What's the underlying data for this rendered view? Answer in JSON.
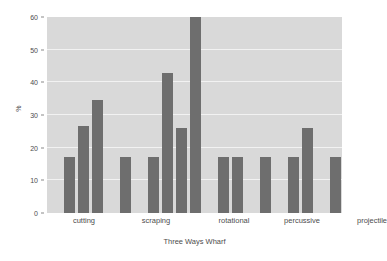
{
  "chart_data": {
    "type": "bar",
    "title": "",
    "subtitle": "",
    "xlabel": "Three Ways Wharf",
    "ylabel": "%",
    "ylim": [
      0,
      60
    ],
    "yticks": [
      0,
      10,
      20,
      30,
      40,
      50,
      60
    ],
    "grid": true,
    "legend": "none",
    "categories": [
      "cutting",
      "scraping",
      "rotational",
      "percussive",
      "projectile"
    ],
    "bar_color": "#6e6e6e",
    "plot_background": "#d9d9d9",
    "gridline_color": "#f2f2f2",
    "bars": [
      {
        "group": "cutting",
        "index": 0,
        "value": 17
      },
      {
        "group": "cutting",
        "index": 1,
        "value": 26.5
      },
      {
        "group": "cutting",
        "index": 2,
        "value": 34.5
      },
      {
        "group": "cutting",
        "index": 3,
        "value": 17
      },
      {
        "group": "scraping",
        "index": 4,
        "value": 17
      },
      {
        "group": "scraping",
        "index": 5,
        "value": 43
      },
      {
        "group": "scraping",
        "index": 6,
        "value": 26
      },
      {
        "group": "scraping",
        "index": 7,
        "value": 60
      },
      {
        "group": "rotational",
        "index": 8,
        "value": 17
      },
      {
        "group": "rotational",
        "index": 9,
        "value": 17
      },
      {
        "group": "rotational",
        "index": 10,
        "value": 17
      },
      {
        "group": "percussive",
        "index": 11,
        "value": 17
      },
      {
        "group": "percussive",
        "index": 12,
        "value": 26
      },
      {
        "group": "projectile",
        "index": 13,
        "value": 17
      },
      {
        "group": "projectile",
        "index": 14,
        "value": 17
      }
    ],
    "bar_x_positions": [
      17,
      31,
      45,
      73,
      101,
      115,
      129,
      143,
      171,
      185,
      213,
      241,
      255,
      283,
      297
    ],
    "bar_width": 11,
    "category_label_x": [
      37,
      109,
      187,
      255,
      325
    ]
  }
}
